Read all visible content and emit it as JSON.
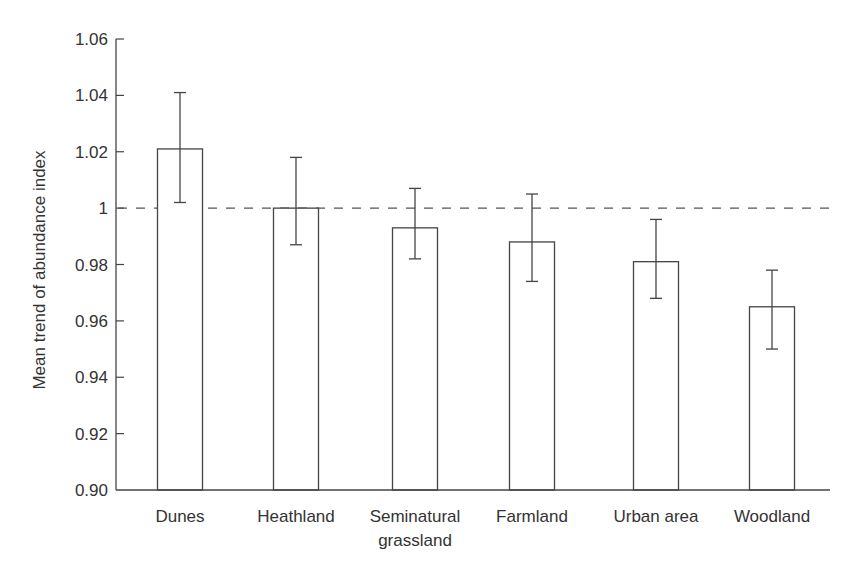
{
  "chart_data": {
    "type": "bar",
    "title": "",
    "xlabel": "",
    "ylabel": "Mean trend of abundance index",
    "ylim": [
      0.9,
      1.06
    ],
    "yticks": [
      "1.06",
      "1.04",
      "1.02",
      "1",
      "0.98",
      "0.96",
      "0.94",
      "0.92",
      "0.90"
    ],
    "ytick_values": [
      1.06,
      1.04,
      1.02,
      1.0,
      0.98,
      0.96,
      0.94,
      0.92,
      0.9
    ],
    "categories": [
      "Dunes",
      "Heathland",
      "Seminatural grassland",
      "Farmland",
      "Urban area",
      "Woodland"
    ],
    "category_lines": [
      [
        "Dunes"
      ],
      [
        "Heathland"
      ],
      [
        "Seminatural",
        "grassland"
      ],
      [
        "Farmland"
      ],
      [
        "Urban area"
      ],
      [
        "Woodland"
      ]
    ],
    "values": [
      1.021,
      1.0,
      0.993,
      0.988,
      0.981,
      0.965
    ],
    "error_upper": [
      1.041,
      1.018,
      1.007,
      1.005,
      0.996,
      0.978
    ],
    "error_lower": [
      1.002,
      0.987,
      0.982,
      0.974,
      0.968,
      0.95
    ],
    "reference_line": {
      "value": 1.0,
      "style": "dashed"
    },
    "grid": false,
    "legend": null,
    "colors": {
      "bar_fill": "#ffffff",
      "bar_stroke": "#444444",
      "axis": "#444444",
      "ref_line": "#555555"
    }
  }
}
